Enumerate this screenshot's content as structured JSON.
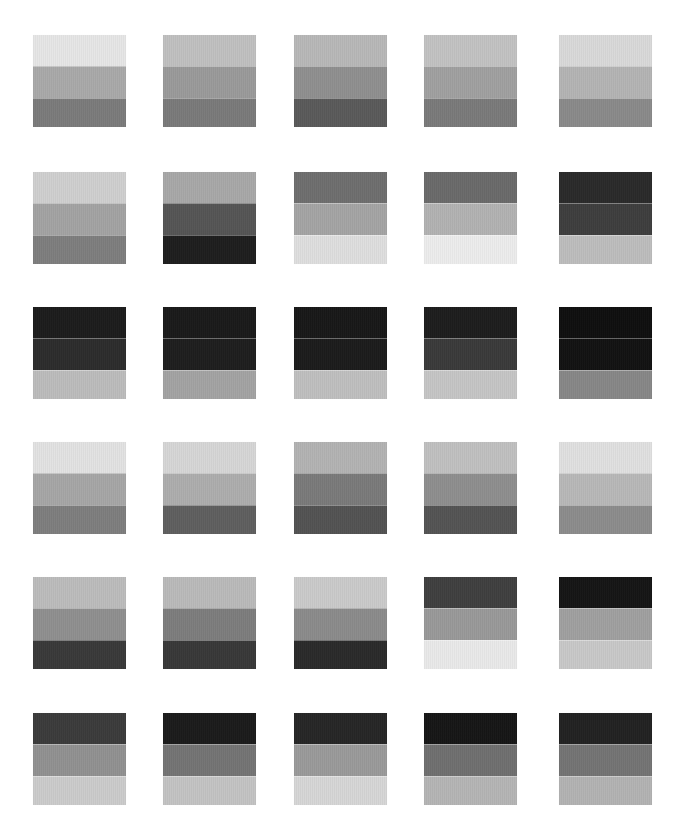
{
  "layout": {
    "columns_x": [
      33,
      163,
      294,
      424,
      559
    ],
    "rows_y": [
      35,
      172,
      307,
      442,
      577,
      713
    ]
  },
  "swatches": [
    {
      "row": 1,
      "col": 1,
      "bands": [
        "#e6e6e6",
        "#a9a9a9",
        "#7b7b7b"
      ]
    },
    {
      "row": 1,
      "col": 2,
      "bands": [
        "#c0c0c0",
        "#9a9a9a",
        "#7a7a7a"
      ]
    },
    {
      "row": 1,
      "col": 3,
      "bands": [
        "#b8b8b8",
        "#8f8f8f",
        "#5a5a5a"
      ]
    },
    {
      "row": 1,
      "col": 4,
      "bands": [
        "#c2c2c2",
        "#a0a0a0",
        "#7a7a7a"
      ]
    },
    {
      "row": 1,
      "col": 5,
      "bands": [
        "#d9d9d9",
        "#b4b4b4",
        "#8a8a8a"
      ]
    },
    {
      "row": 2,
      "col": 1,
      "bands": [
        "#cfcfcf",
        "#a3a3a3",
        "#7e7e7e"
      ]
    },
    {
      "row": 2,
      "col": 2,
      "bands": [
        "#a8a8a8",
        "#555555",
        "#1e1e1e"
      ]
    },
    {
      "row": 2,
      "col": 3,
      "bands": [
        "#6e6e6e",
        "#a4a4a4",
        "#dedede"
      ]
    },
    {
      "row": 2,
      "col": 4,
      "bands": [
        "#6a6a6a",
        "#b2b2b2",
        "#ececec"
      ]
    },
    {
      "row": 2,
      "col": 5,
      "bands": [
        "#2a2a2a",
        "#3e3e3e",
        "#bdbdbd"
      ]
    },
    {
      "row": 3,
      "col": 1,
      "bands": [
        "#1c1c1c",
        "#2c2c2c",
        "#bcbcbc"
      ]
    },
    {
      "row": 3,
      "col": 2,
      "bands": [
        "#1a1a1a",
        "#1e1e1e",
        "#a3a3a3"
      ]
    },
    {
      "row": 3,
      "col": 3,
      "bands": [
        "#181818",
        "#1c1c1c",
        "#bfbfbf"
      ]
    },
    {
      "row": 3,
      "col": 4,
      "bands": [
        "#1d1d1d",
        "#3a3a3a",
        "#c5c5c5"
      ]
    },
    {
      "row": 3,
      "col": 5,
      "bands": [
        "#0f0f0f",
        "#121212",
        "#878787"
      ]
    },
    {
      "row": 4,
      "col": 1,
      "bands": [
        "#e2e2e2",
        "#a6a6a6",
        "#7e7e7e"
      ]
    },
    {
      "row": 4,
      "col": 2,
      "bands": [
        "#d6d6d6",
        "#adadad",
        "#5f5f5f"
      ]
    },
    {
      "row": 4,
      "col": 3,
      "bands": [
        "#b3b3b3",
        "#7a7a7a",
        "#535353"
      ]
    },
    {
      "row": 4,
      "col": 4,
      "bands": [
        "#c0c0c0",
        "#8e8e8e",
        "#545454"
      ]
    },
    {
      "row": 4,
      "col": 5,
      "bands": [
        "#e0e0e0",
        "#b8b8b8",
        "#8c8c8c"
      ]
    },
    {
      "row": 5,
      "col": 1,
      "bands": [
        "#bcbcbc",
        "#8f8f8f",
        "#393939"
      ]
    },
    {
      "row": 5,
      "col": 2,
      "bands": [
        "#bababa",
        "#7d7d7d",
        "#383838"
      ]
    },
    {
      "row": 5,
      "col": 3,
      "bands": [
        "#cacaca",
        "#8b8b8b",
        "#2a2a2a"
      ]
    },
    {
      "row": 5,
      "col": 4,
      "bands": [
        "#3f3f3f",
        "#999999",
        "#e9e9e9"
      ]
    },
    {
      "row": 5,
      "col": 5,
      "bands": [
        "#151515",
        "#a0a0a0",
        "#c8c8c8"
      ]
    },
    {
      "row": 6,
      "col": 1,
      "bands": [
        "#3b3b3b",
        "#919191",
        "#cbcbcb"
      ]
    },
    {
      "row": 6,
      "col": 2,
      "bands": [
        "#1b1b1b",
        "#747474",
        "#c3c3c3"
      ]
    },
    {
      "row": 6,
      "col": 3,
      "bands": [
        "#262626",
        "#9a9a9a",
        "#d6d6d6"
      ]
    },
    {
      "row": 6,
      "col": 4,
      "bands": [
        "#161616",
        "#6f6f6f",
        "#b5b5b5"
      ]
    },
    {
      "row": 6,
      "col": 5,
      "bands": [
        "#222222",
        "#747474",
        "#b3b3b3"
      ]
    }
  ]
}
